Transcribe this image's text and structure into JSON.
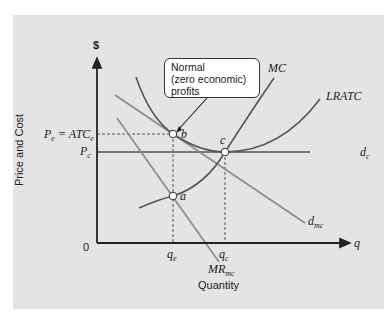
{
  "diagram": {
    "y_axis": {
      "symbol": "$",
      "label": "Price and Cost"
    },
    "x_axis": {
      "symbol": "q",
      "label": "Quantity",
      "origin": "0"
    },
    "price_labels": {
      "pe_atce": "P",
      "pe_sub": "e",
      "eq": " = ATC",
      "atce_sub": "e",
      "pc": "P",
      "pc_sub": "c"
    },
    "quantity_labels": {
      "qe": "q",
      "qe_sub": "e",
      "qc": "q",
      "qc_sub": "c"
    },
    "curves": {
      "mc": "MC",
      "lratc": "LRATC",
      "dc": "d",
      "dc_sub": "c",
      "dmc": "d",
      "dmc_sub": "mc",
      "mrmc": "MR",
      "mrmc_sub": "mc"
    },
    "points": {
      "a": "a",
      "b": "b",
      "c": "c"
    },
    "callout": {
      "line1": "Normal",
      "line2": "(zero economic)",
      "line3": "profits"
    },
    "colors": {
      "panel": "#e4e4e4",
      "axis": "#222222",
      "curve_dark": "#555555",
      "curve_light": "#8a8a8a"
    }
  }
}
